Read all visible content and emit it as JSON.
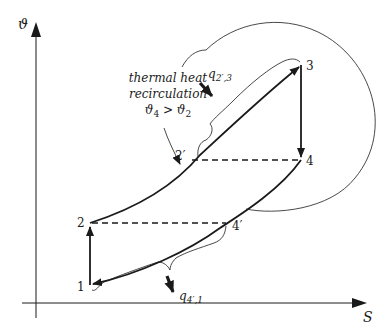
{
  "diagram": {
    "type": "thermodynamic T-S cycle",
    "axes": {
      "y_label": "ϑ",
      "x_label": "S"
    },
    "points": {
      "p1": "1",
      "p2": "2",
      "p2prime": "2′",
      "p3": "3",
      "p4": "4",
      "p4prime": "4′"
    },
    "heat_labels": {
      "q_in": "q",
      "q_in_sub": "2′,3",
      "q_out": "q",
      "q_out_sub": "4′,1"
    },
    "annotation": {
      "line1": "thermal heat",
      "line2": "recirculation",
      "line3": "ϑ4 > ϑ2",
      "line3_a": "ϑ",
      "line3_a_sub": "4",
      "line3_op": " > ",
      "line3_b": "ϑ",
      "line3_b_sub": "2"
    },
    "colors": {
      "stroke": "#1a1a1a",
      "background": "#ffffff"
    }
  }
}
